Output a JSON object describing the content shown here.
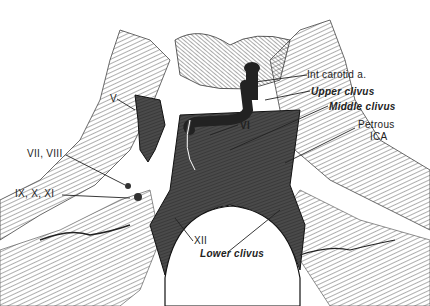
{
  "figure": {
    "labels": {
      "int_carotid": "Int carotid a.",
      "upper_clivus": "Upper clivus",
      "middle_clivus": "Middle clivus",
      "petrous_1": "Petrous",
      "petrous_2": "ICA",
      "v": "V",
      "vi": "VI",
      "vii_viii": "VII, VIII",
      "ix_x_xi": "IX, X, XI",
      "xii": "XII",
      "lower_clivus": "Lower clivus"
    },
    "colors": {
      "ink": "#1a1a1a",
      "clivus_fill": "#5a5a5a",
      "hatch": "#888888",
      "background": "#ffffff"
    }
  }
}
